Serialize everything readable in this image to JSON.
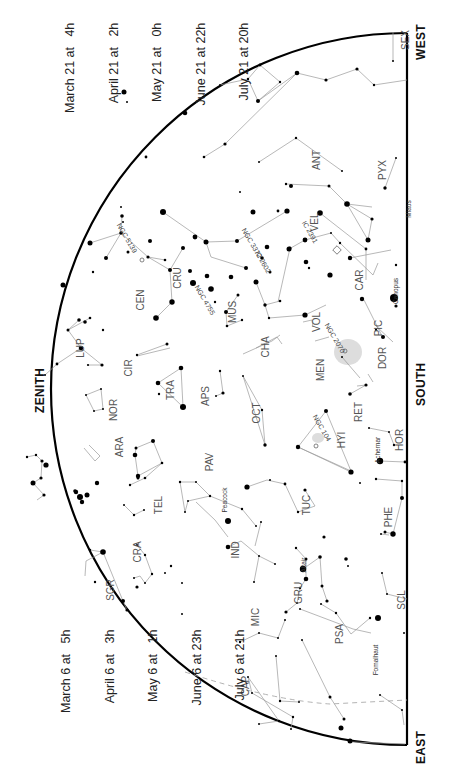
{
  "directions": {
    "zenith": "ZENITH",
    "south": "SOUTH",
    "west": "WEST",
    "east": "EAST"
  },
  "times_top": [
    "March 21 at   4h",
    "April 21 at   2h",
    "May 21 at   0h",
    "June 21 at 22h",
    "July 21 at 20h"
  ],
  "times_bottom": [
    "March 6 at   5h",
    "April 6 at   3h",
    "May 6 at   1h",
    "June 6 at 23h",
    "July 6 at 21h"
  ],
  "constellations": [
    {
      "abbr": "SEX",
      "x": 405,
      "y": 40
    },
    {
      "abbr": "ANT",
      "x": 316,
      "y": 160
    },
    {
      "abbr": "PYX",
      "x": 382,
      "y": 170
    },
    {
      "abbr": "VEL",
      "x": 314,
      "y": 222
    },
    {
      "abbr": "CAR",
      "x": 359,
      "y": 280
    },
    {
      "abbr": "CEN",
      "x": 140,
      "y": 300
    },
    {
      "abbr": "CRU",
      "x": 177,
      "y": 278
    },
    {
      "abbr": "MUS",
      "x": 232,
      "y": 312
    },
    {
      "abbr": "LUP",
      "x": 80,
      "y": 348
    },
    {
      "abbr": "CIR",
      "x": 128,
      "y": 368
    },
    {
      "abbr": "CHA",
      "x": 265,
      "y": 347
    },
    {
      "abbr": "VOL",
      "x": 316,
      "y": 322
    },
    {
      "abbr": "PIC",
      "x": 378,
      "y": 328
    },
    {
      "abbr": "DOR",
      "x": 382,
      "y": 358
    },
    {
      "abbr": "MEN",
      "x": 320,
      "y": 370
    },
    {
      "abbr": "TRA",
      "x": 170,
      "y": 390
    },
    {
      "abbr": "APS",
      "x": 205,
      "y": 396
    },
    {
      "abbr": "NOR",
      "x": 113,
      "y": 410
    },
    {
      "abbr": "OCT",
      "x": 256,
      "y": 413
    },
    {
      "abbr": "RET",
      "x": 358,
      "y": 412
    },
    {
      "abbr": "HYI",
      "x": 341,
      "y": 440
    },
    {
      "abbr": "HOR",
      "x": 399,
      "y": 440
    },
    {
      "abbr": "ARA",
      "x": 119,
      "y": 447
    },
    {
      "abbr": "PAV",
      "x": 209,
      "y": 462
    },
    {
      "abbr": "TEL",
      "x": 158,
      "y": 505
    },
    {
      "abbr": "TUC",
      "x": 306,
      "y": 505
    },
    {
      "abbr": "PHE",
      "x": 388,
      "y": 517
    },
    {
      "abbr": "CRA",
      "x": 137,
      "y": 552
    },
    {
      "abbr": "IND",
      "x": 235,
      "y": 550
    },
    {
      "abbr": "GRU",
      "x": 298,
      "y": 593
    },
    {
      "abbr": "SGR",
      "x": 110,
      "y": 590
    },
    {
      "abbr": "SCL",
      "x": 401,
      "y": 600
    },
    {
      "abbr": "MIC",
      "x": 255,
      "y": 617
    },
    {
      "abbr": "PSA",
      "x": 339,
      "y": 634
    },
    {
      "abbr": "CAP",
      "x": 245,
      "y": 686
    }
  ],
  "star_names": [
    {
      "name": "Miaos",
      "x": 408,
      "y": 209
    },
    {
      "name": "Canopus",
      "x": 395,
      "y": 291
    },
    {
      "name": "Achernar",
      "x": 377,
      "y": 450
    },
    {
      "name": "Peacock",
      "x": 224,
      "y": 500
    },
    {
      "name": "Altair",
      "x": 303,
      "y": 565
    },
    {
      "name": "Fomalhaut",
      "x": 375,
      "y": 660
    }
  ],
  "deep_sky": [
    {
      "name": "NGC 5139",
      "x": 127,
      "y": 238,
      "angle": 60
    },
    {
      "name": "NGC 4755",
      "x": 205,
      "y": 300,
      "angle": 60
    },
    {
      "name": "NGC 3372",
      "x": 252,
      "y": 243,
      "angle": 60
    },
    {
      "name": "IC 2602",
      "x": 263,
      "y": 262,
      "angle": 60
    },
    {
      "name": "IC 2391",
      "x": 310,
      "y": 232,
      "angle": 60
    },
    {
      "name": "NGC 2070",
      "x": 335,
      "y": 338,
      "angle": 60
    },
    {
      "name": "NGC 104",
      "x": 322,
      "y": 428,
      "angle": 60
    }
  ]
}
